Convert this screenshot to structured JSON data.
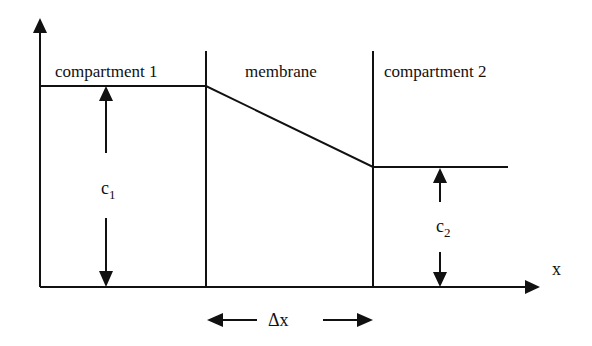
{
  "diagram": {
    "labels": {
      "compartment1": "compartment 1",
      "membrane": "membrane",
      "compartment2": "compartment 2",
      "c1_main": "c",
      "c1_sub": "1",
      "c2_main": "c",
      "c2_sub": "2",
      "x_axis": "x",
      "delta_x": "Δx"
    },
    "colors": {
      "stroke": "#111111",
      "background": "#ffffff"
    }
  }
}
